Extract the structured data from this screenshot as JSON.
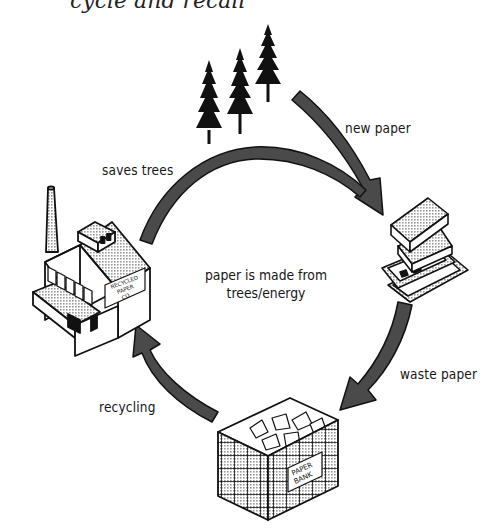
{
  "diagram": {
    "heading": "cycle and recall",
    "title_visibility": "clipped-top",
    "center_text": {
      "line1": "paper is made from",
      "line2": "trees/energy"
    },
    "nodes": [
      {
        "id": "trees",
        "label": "trees",
        "icon": "pine-trees-icon"
      },
      {
        "id": "books",
        "label": "books and magazines",
        "icon": "book-stack-icon"
      },
      {
        "id": "paper-bank",
        "label": "PAPER BANK",
        "icon": "paper-bank-bin-icon"
      },
      {
        "id": "factory",
        "label": "RECYCLED PAPER CO.",
        "icon": "factory-icon"
      }
    ],
    "edges": [
      {
        "from": "trees",
        "to": "books",
        "label": "new paper"
      },
      {
        "from": "books",
        "to": "paper-bank",
        "label": "waste paper"
      },
      {
        "from": "paper-bank",
        "to": "factory",
        "label": "recycling"
      },
      {
        "from": "factory",
        "to": "books",
        "label": "saves trees"
      }
    ],
    "factory_sign": {
      "line1": "RECYCLED",
      "line2": "PAPER",
      "line3": "CO."
    },
    "bin_sign": {
      "line1": "PAPER",
      "line2": "BANK"
    },
    "colors": {
      "arrow_fill": "#4a4a4a",
      "outline": "#111111",
      "hatch": "#b9b9b9",
      "background": "#ffffff"
    }
  }
}
